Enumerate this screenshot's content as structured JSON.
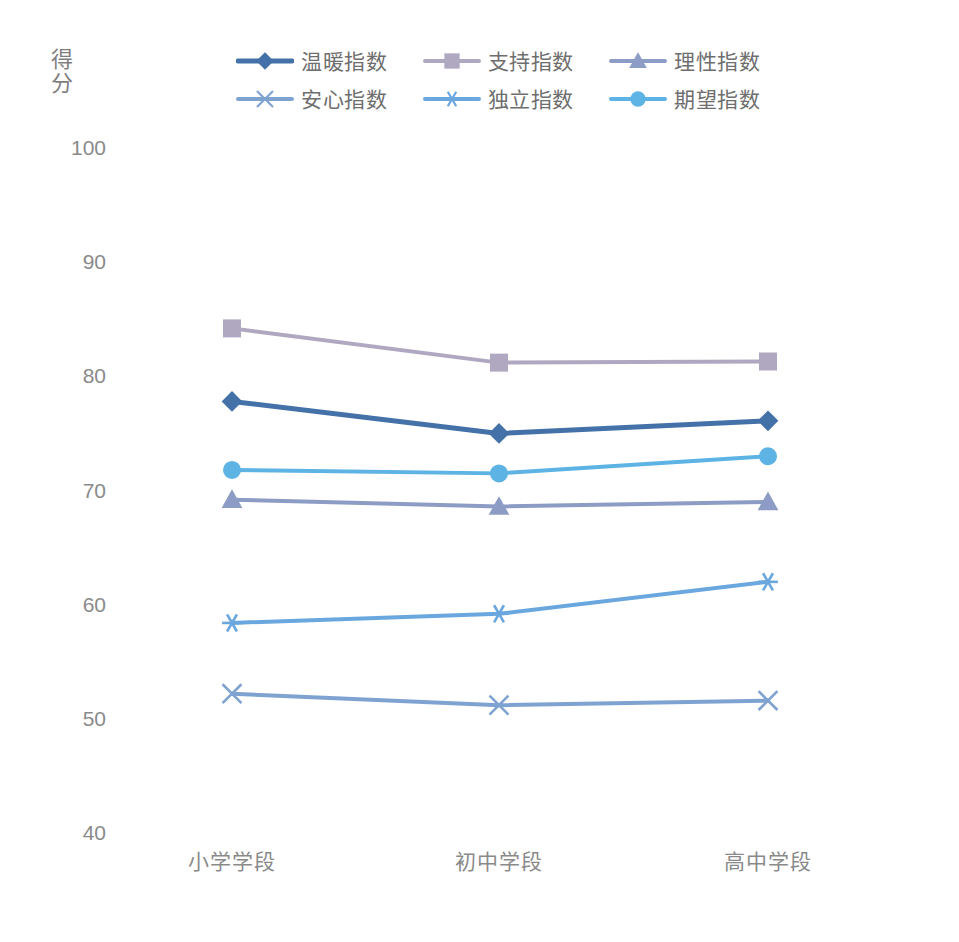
{
  "chart_data": {
    "type": "line",
    "title": "",
    "xlabel": "",
    "ylabel": "得分",
    "categories": [
      "小学学段",
      "初中学段",
      "高中学段"
    ],
    "ylim": [
      40,
      100
    ],
    "yticks": [
      100,
      90,
      80,
      70,
      60,
      50,
      40
    ],
    "grid": false,
    "legend_position": "top",
    "series": [
      {
        "name": "温暖指数",
        "values": [
          77.8,
          75.0,
          76.1
        ],
        "color": "#4472a8",
        "marker": "diamond"
      },
      {
        "name": "支持指数",
        "values": [
          84.2,
          81.2,
          81.3
        ],
        "color": "#b0a8c0",
        "marker": "square"
      },
      {
        "name": "理性指数",
        "values": [
          69.2,
          68.6,
          69.0
        ],
        "color": "#8d9cc4",
        "marker": "triangle"
      },
      {
        "name": "安心指数",
        "values": [
          52.2,
          51.2,
          51.6
        ],
        "color": "#7fa3d1",
        "marker": "x"
      },
      {
        "name": "独立指数",
        "values": [
          58.4,
          59.2,
          62.0
        ],
        "color": "#6aa7de",
        "marker": "asterisk"
      },
      {
        "name": "期望指数",
        "values": [
          71.8,
          71.5,
          73.0
        ],
        "color": "#5cb3e4",
        "marker": "circle"
      }
    ]
  },
  "axis": {
    "y_title": "得分",
    "y_tick_labels": [
      "100",
      "90",
      "80",
      "70",
      "60",
      "50",
      "40"
    ],
    "x_tick_labels": [
      "小学学段",
      "初中学段",
      "高中学段"
    ]
  },
  "legend": {
    "items": [
      {
        "label": "温暖指数"
      },
      {
        "label": "支持指数"
      },
      {
        "label": "理性指数"
      },
      {
        "label": "安心指数"
      },
      {
        "label": "独立指数"
      },
      {
        "label": "期望指数"
      }
    ]
  }
}
